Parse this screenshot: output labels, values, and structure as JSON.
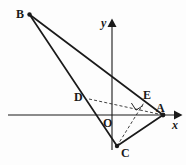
{
  "figure": {
    "type": "geometry-diagram",
    "width": 186,
    "height": 165,
    "background_color": "#fdfdfd",
    "stroke_color": "#1a1a1a"
  },
  "axes": {
    "x_axis": {
      "label": "x",
      "label_x": 173,
      "label_y": 120,
      "line_x1": 8,
      "line_y1": 115,
      "line_x2": 176,
      "line_y2": 115,
      "arrow_tip_x": 182,
      "arrow_tip_y": 115,
      "has_arrow": true
    },
    "y_axis": {
      "label": "y",
      "label_x": 102,
      "label_y": 18,
      "line_x1": 112,
      "line_y1": 26,
      "line_x2": 112,
      "line_y2": 150,
      "arrow_tip_x": 112,
      "arrow_tip_y": 19,
      "has_arrow": true
    },
    "origin": {
      "label": "O",
      "label_x": 104,
      "label_y": 118,
      "x": 112,
      "y": 115
    }
  },
  "points": [
    {
      "name": "B",
      "x": 29.5,
      "y": 14.5,
      "label": "B",
      "label_x": 16,
      "label_y": 9,
      "dot": true
    },
    {
      "name": "A",
      "x": 163.0,
      "y": 115.0,
      "label": "A",
      "label_x": 156,
      "label_y": 103,
      "dot": true
    },
    {
      "name": "C",
      "x": 117.0,
      "y": 146.0,
      "label": "C",
      "label_x": 121,
      "label_y": 148,
      "dot": true
    },
    {
      "name": "D",
      "x": 89.0,
      "y": 99.0,
      "label": "D",
      "label_x": 75,
      "label_y": 92,
      "dot": false
    },
    {
      "name": "E",
      "x": 145.0,
      "y": 101.0,
      "label": "E",
      "label_x": 144,
      "label_y": 90,
      "dot": false
    }
  ],
  "solid_segments": [
    {
      "name": "segment-BA",
      "from": "B",
      "to": "A",
      "x1": 29.5,
      "y1": 14.5,
      "x2": 163.0,
      "y2": 115.0
    },
    {
      "name": "segment-BC",
      "from": "B",
      "to": "C",
      "x1": 29.5,
      "y1": 14.5,
      "x2": 117.0,
      "y2": 146.0
    },
    {
      "name": "segment-CA",
      "from": "C",
      "to": "A",
      "x1": 117.0,
      "y1": 146.0,
      "x2": 163.0,
      "y2": 115.0
    }
  ],
  "dashed_segments": [
    {
      "name": "segment-DA",
      "from": "D",
      "to": "A",
      "x1": 89.0,
      "y1": 99.0,
      "x2": 163.0,
      "y2": 115.0
    },
    {
      "name": "segment-CE",
      "from": "C",
      "to": "E",
      "x1": 117.0,
      "y1": 146.0,
      "x2": 145.0,
      "y2": 101.0
    }
  ],
  "right_angle_mark": {
    "name": "right-angle-at-intersection",
    "vertex_x": 137.0,
    "vertex_y": 107.0,
    "size": 7,
    "description": "Right angle where AD crosses CE"
  },
  "stroke_widths": {
    "axis": 1.1,
    "solid": 1.6,
    "dashed": 0.9
  },
  "dash_pattern": "3,2.2"
}
